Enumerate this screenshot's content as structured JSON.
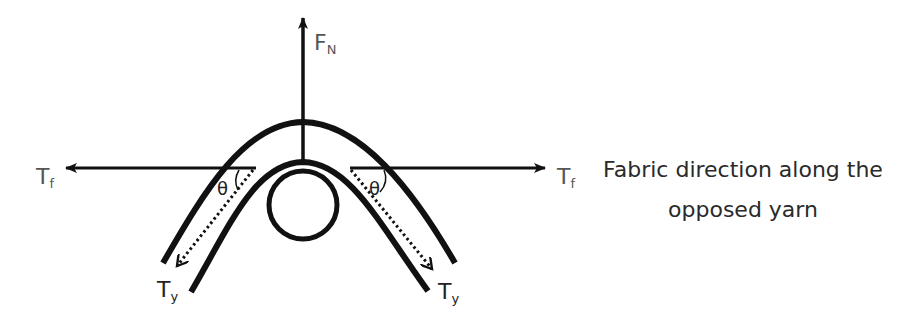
{
  "diagram": {
    "labels": {
      "normal_force": {
        "main": "F",
        "sub": "N"
      },
      "fabric_tension_left": {
        "main": "T",
        "sub": "f"
      },
      "fabric_tension_right": {
        "main": "T",
        "sub": "f"
      },
      "yarn_tension_left": {
        "main": "T",
        "sub": "y"
      },
      "yarn_tension_right": {
        "main": "T",
        "sub": "y"
      },
      "angle_left": "θ",
      "angle_right": "θ"
    },
    "caption": {
      "line1": "Fabric direction along the",
      "line2": "opposed yarn"
    },
    "colors": {
      "stroke": "#111111",
      "label": "#555555",
      "text": "#2a2a2a"
    }
  }
}
